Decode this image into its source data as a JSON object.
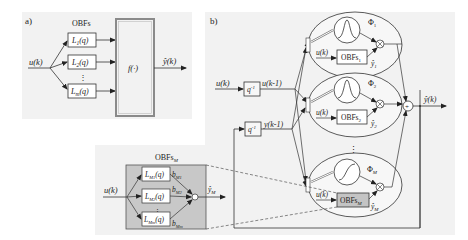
{
  "panel_a": {
    "label": "a)",
    "group_title": "OBFs",
    "input": "u(k)",
    "filters": [
      "L1(q)",
      "L2(q)",
      "Lm(q)"
    ],
    "filter_main": [
      "L",
      "L",
      "L"
    ],
    "filter_sub": [
      "1",
      "2",
      "m"
    ],
    "filter_arg": [
      "(q)",
      "(q)",
      "(q)"
    ],
    "ellipsis": "⋮",
    "nonlinear_block": "f(·)",
    "output": "ŷ(k)"
  },
  "panel_b": {
    "label": "b)",
    "input_u": "u(k)",
    "delay": "q",
    "delay_exp": "-1",
    "delayed_u": "u(k-1)",
    "delayed_y": "y(k-1)",
    "local_models": [
      {
        "phi": "Φ",
        "phi_sub": "1",
        "obf": "OBFs",
        "obf_sub": "1",
        "yhat": "ŷ",
        "yhat_sub": "1",
        "input": "u(k)",
        "shape": "gaussian"
      },
      {
        "phi": "Φ",
        "phi_sub": "2",
        "obf": "OBFs",
        "obf_sub": "2",
        "yhat": "ŷ",
        "yhat_sub": "2",
        "input": "u(k)",
        "shape": "gaussian"
      },
      {
        "phi": "Φ",
        "phi_sub": "M",
        "obf": "OBFs",
        "obf_sub": "M",
        "yhat": "ŷ",
        "yhat_sub": "M",
        "input": "u(k)",
        "shape": "sigmoid"
      }
    ],
    "ellipsis": "⋮",
    "sum": "+",
    "product": "⊗",
    "output": "ŷ(k)"
  },
  "inset": {
    "title": "OBFs",
    "title_sub": "M",
    "input": "u(k)",
    "filters": [
      {
        "main": "L",
        "sub": "M1",
        "arg": "(q)",
        "weight": "b",
        "weight_sub": "M1"
      },
      {
        "main": "L",
        "sub": "M2",
        "arg": "(q)",
        "weight": "b",
        "weight_sub": "M2"
      },
      {
        "main": "L",
        "sub": "Mm",
        "arg": "(q)",
        "weight": "b",
        "weight_sub": "Mm"
      }
    ],
    "ellipsis": "⋮",
    "output": "ŷ",
    "output_sub": "M"
  },
  "colors": {
    "panel_bg": "#f2f2f2",
    "line": "#333333",
    "nonlinear_border": "#8a8a8a",
    "inset_fill": "#c8c8c8",
    "obfm_fill": "#c4c4c4",
    "dash": "#555555"
  }
}
